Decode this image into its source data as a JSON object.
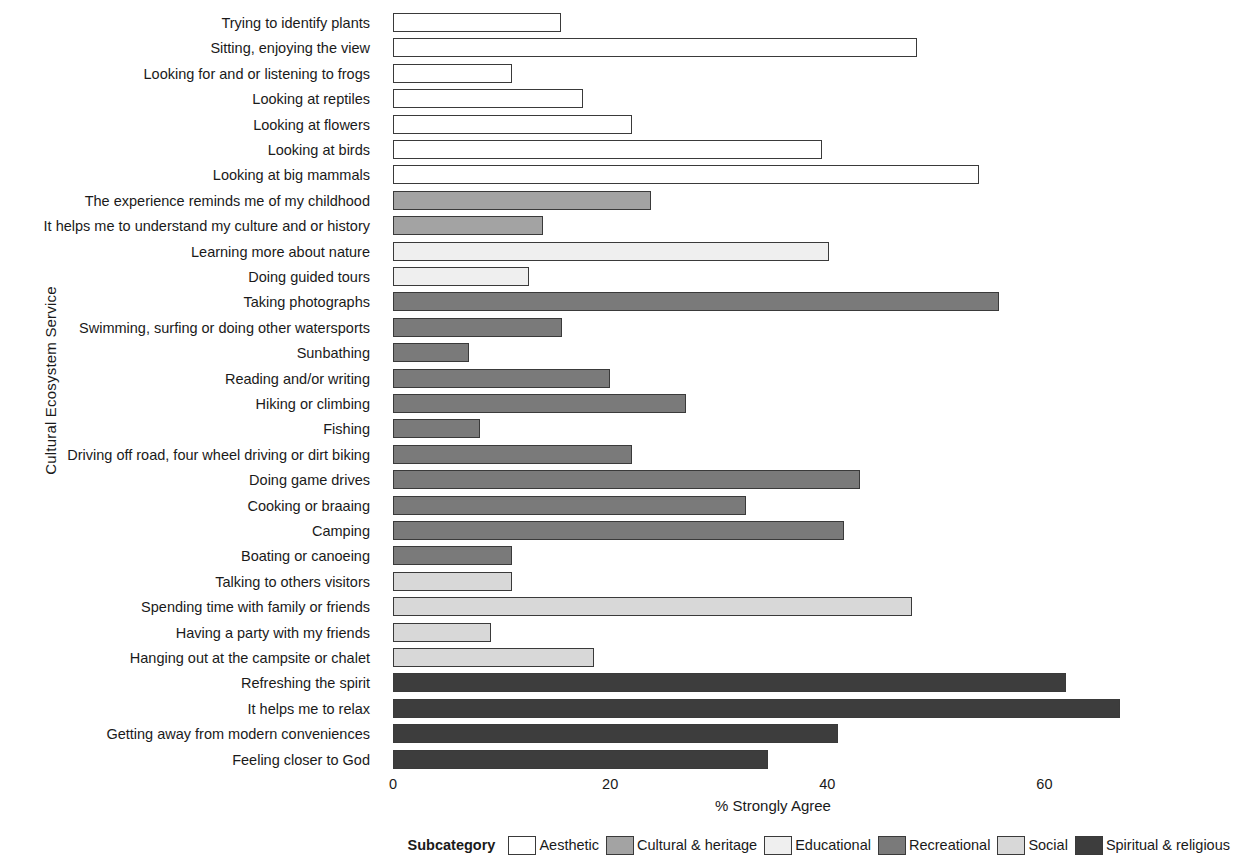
{
  "chart_data": {
    "type": "bar",
    "orientation": "horizontal",
    "title": "",
    "xlabel": "% Strongly Agree",
    "ylabel": "Cultural Ecosystem Service",
    "xlim": [
      0,
      70
    ],
    "xticks": [
      0,
      20,
      40,
      60
    ],
    "xtick_labels": [
      "0",
      "20",
      "40",
      "60"
    ],
    "grid": false,
    "legend_position": "bottom-right",
    "legend_title": "Subcategory",
    "legend_entries": [
      {
        "label": "Aesthetic",
        "color": "#ffffff"
      },
      {
        "label": "Cultural & heritage",
        "color": "#a3a3a3"
      },
      {
        "label": "Educational",
        "color": "#efefef"
      },
      {
        "label": "Recreational",
        "color": "#7a7a7a"
      },
      {
        "label": "Social",
        "color": "#d8d8d8"
      },
      {
        "label": "Spiritual & religious",
        "color": "#3d3d3d"
      }
    ],
    "categories": [
      "Trying to identify plants",
      "Sitting, enjoying the view",
      "Looking for and or listening to frogs",
      "Looking at reptiles",
      "Looking at flowers",
      "Looking at birds",
      "Looking at big mammals",
      "The experience reminds me of my childhood",
      "It helps me to understand my culture and or history",
      "Learning more about nature",
      "Doing guided tours",
      "Taking photographs",
      "Swimming, surfing or doing other watersports",
      "Sunbathing",
      "Reading and/or writing",
      "Hiking or climbing",
      "Fishing",
      "Driving off road, four wheel driving or dirt biking",
      "Doing game drives",
      "Cooking or braaing",
      "Camping",
      "Boating or canoeing",
      "Talking to others visitors",
      "Spending time with family or friends",
      "Having a party with my friends",
      "Hanging out at the campsite or chalet",
      "Refreshing the spirit",
      "It helps me to relax",
      "Getting away from modern conveniences",
      "Feeling closer to God"
    ],
    "values": [
      15.5,
      48.3,
      11.0,
      17.5,
      22.0,
      39.5,
      54.0,
      23.8,
      13.8,
      40.2,
      12.5,
      55.8,
      15.6,
      7.0,
      20.0,
      27.0,
      8.0,
      22.0,
      43.0,
      32.5,
      41.5,
      11.0,
      11.0,
      47.8,
      9.0,
      18.5,
      62.0,
      67.0,
      41.0,
      34.5
    ],
    "subcategories": [
      "Aesthetic",
      "Aesthetic",
      "Aesthetic",
      "Aesthetic",
      "Aesthetic",
      "Aesthetic",
      "Aesthetic",
      "Cultural & heritage",
      "Cultural & heritage",
      "Educational",
      "Educational",
      "Recreational",
      "Recreational",
      "Recreational",
      "Recreational",
      "Recreational",
      "Recreational",
      "Recreational",
      "Recreational",
      "Recreational",
      "Recreational",
      "Recreational",
      "Social",
      "Social",
      "Social",
      "Social",
      "Spiritual & religious",
      "Spiritual & religious",
      "Spiritual & religious",
      "Spiritual & religious"
    ],
    "colors": [
      "#ffffff",
      "#ffffff",
      "#ffffff",
      "#ffffff",
      "#ffffff",
      "#ffffff",
      "#ffffff",
      "#a3a3a3",
      "#a3a3a3",
      "#efefef",
      "#efefef",
      "#7a7a7a",
      "#7a7a7a",
      "#7a7a7a",
      "#7a7a7a",
      "#7a7a7a",
      "#7a7a7a",
      "#7a7a7a",
      "#7a7a7a",
      "#7a7a7a",
      "#7a7a7a",
      "#7a7a7a",
      "#d8d8d8",
      "#d8d8d8",
      "#d8d8d8",
      "#d8d8d8",
      "#3d3d3d",
      "#3d3d3d",
      "#3d3d3d",
      "#3d3d3d"
    ]
  }
}
